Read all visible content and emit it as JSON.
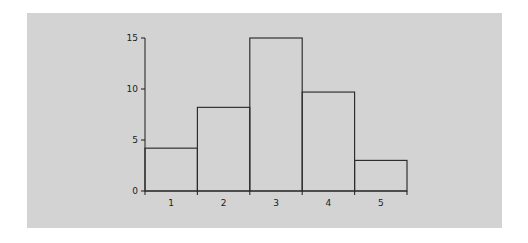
{
  "figure": {
    "background_color": "#ffffff",
    "panel_color": "#d3d3d3"
  },
  "chart_data": {
    "type": "bar",
    "title": "",
    "subtitle": "",
    "xlabel": "",
    "ylabel": "",
    "categories": [
      "1",
      "2",
      "3",
      "4",
      "5"
    ],
    "values": [
      4.2,
      8.2,
      15.0,
      9.7,
      3.0
    ],
    "bin_edges": [
      0.5,
      1.5,
      2.5,
      3.5,
      4.5,
      5.5
    ],
    "x_tick_labels": [
      "1",
      "2",
      "3",
      "4",
      "5"
    ],
    "y_tick_labels": [
      "0",
      "5",
      "10",
      "15"
    ],
    "y_ticks": [
      0,
      5,
      10,
      15
    ],
    "ylim": [
      0,
      15.6
    ],
    "xlim": [
      0.5,
      5.5
    ],
    "grid": false,
    "legend": false,
    "legend_entries": [],
    "bar_fill": "none",
    "bar_edge_color": "#2b2b2b",
    "axis_color": "#2b2b2b",
    "annotations": []
  }
}
